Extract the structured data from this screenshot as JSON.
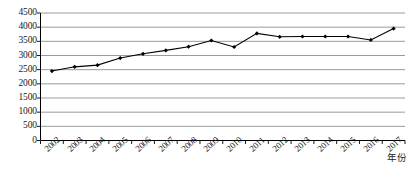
{
  "chart_data": {
    "type": "line",
    "title": "",
    "xlabel": "年份",
    "ylabel": "",
    "categories": [
      "2002",
      "2003",
      "2004",
      "2005",
      "2006",
      "2007",
      "2008",
      "2009",
      "2010",
      "2011",
      "2012",
      "2013",
      "2014",
      "2015",
      "2016",
      "2017"
    ],
    "values": [
      2450,
      2600,
      2660,
      2910,
      3060,
      3180,
      3310,
      3530,
      3300,
      3780,
      3660,
      3670,
      3670,
      3670,
      3550,
      3950
    ],
    "series": [
      {
        "name": "",
        "values": [
          2450,
          2600,
          2660,
          2910,
          3060,
          3180,
          3310,
          3530,
          3300,
          3780,
          3660,
          3670,
          3670,
          3670,
          3550,
          3950
        ]
      }
    ],
    "ylim": [
      0,
      4500
    ],
    "ytick_step": 500,
    "yticks": [
      0,
      500,
      1000,
      1500,
      2000,
      2500,
      3000,
      3500,
      4000,
      4500
    ],
    "ytick_labels": [
      "0",
      "500",
      "1000",
      "1500",
      "2000",
      "2500",
      "3000",
      "3500",
      "4000",
      "4500"
    ],
    "grid": true,
    "grid_axis": "y",
    "legend": false,
    "legend_position": "none",
    "marker": "diamond",
    "line_color": "#000000",
    "marker_color": "#000000",
    "grid_color": "#808080",
    "axis_color": "#000000",
    "background_color": "#ffffff",
    "xtick_rotation": -42
  }
}
